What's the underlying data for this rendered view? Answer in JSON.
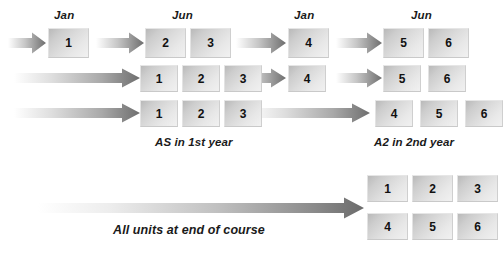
{
  "diagram": {
    "title_labels": {
      "timeline_months": [
        {
          "text": "Jan",
          "x": 54,
          "y": 9
        },
        {
          "text": "Jun",
          "x": 172,
          "y": 9
        },
        {
          "text": "Jan",
          "x": 294,
          "y": 9
        },
        {
          "text": "Jun",
          "x": 411,
          "y": 9
        }
      ]
    },
    "rows": [
      {
        "name": "route-row-1",
        "arrows": [
          {
            "x": 8,
            "y": 32,
            "w": 38,
            "h": 22
          },
          {
            "x": 96,
            "y": 32,
            "w": 48,
            "h": 22
          },
          {
            "x": 236,
            "y": 32,
            "w": 50,
            "h": 22
          },
          {
            "x": 336,
            "y": 32,
            "w": 46,
            "h": 22
          }
        ],
        "units": [
          {
            "label": "1",
            "x": 48,
            "y": 28,
            "w": 41,
            "h": 30
          },
          {
            "label": "2",
            "x": 145,
            "y": 28,
            "w": 41,
            "h": 30
          },
          {
            "label": "3",
            "x": 190,
            "y": 28,
            "w": 41,
            "h": 30
          },
          {
            "label": "4",
            "x": 288,
            "y": 28,
            "w": 41,
            "h": 30
          },
          {
            "label": "5",
            "x": 383,
            "y": 28,
            "w": 41,
            "h": 30
          },
          {
            "label": "6",
            "x": 428,
            "y": 28,
            "w": 41,
            "h": 30
          }
        ]
      },
      {
        "name": "route-row-2",
        "arrows": [
          {
            "x": 14,
            "y": 68,
            "w": 126,
            "h": 20
          },
          {
            "x": 236,
            "y": 68,
            "w": 50,
            "h": 20
          },
          {
            "x": 336,
            "y": 68,
            "w": 46,
            "h": 20
          }
        ],
        "units": [
          {
            "label": "1",
            "x": 140,
            "y": 65,
            "w": 38,
            "h": 27
          },
          {
            "label": "2",
            "x": 182,
            "y": 65,
            "w": 38,
            "h": 27
          },
          {
            "label": "3",
            "x": 224,
            "y": 65,
            "w": 38,
            "h": 27
          },
          {
            "label": "4",
            "x": 288,
            "y": 65,
            "w": 38,
            "h": 27
          },
          {
            "label": "5",
            "x": 383,
            "y": 65,
            "w": 38,
            "h": 27
          },
          {
            "label": "6",
            "x": 428,
            "y": 65,
            "w": 38,
            "h": 27
          }
        ]
      },
      {
        "name": "route-row-3",
        "arrows": [
          {
            "x": 14,
            "y": 103,
            "w": 126,
            "h": 20
          },
          {
            "x": 248,
            "y": 103,
            "w": 122,
            "h": 20
          }
        ],
        "units": [
          {
            "label": "1",
            "x": 140,
            "y": 100,
            "w": 38,
            "h": 27
          },
          {
            "label": "2",
            "x": 182,
            "y": 100,
            "w": 38,
            "h": 27
          },
          {
            "label": "3",
            "x": 224,
            "y": 100,
            "w": 38,
            "h": 27
          },
          {
            "label": "4",
            "x": 375,
            "y": 100,
            "w": 38,
            "h": 27
          },
          {
            "label": "5",
            "x": 420,
            "y": 100,
            "w": 38,
            "h": 27
          },
          {
            "label": "6",
            "x": 465,
            "y": 100,
            "w": 38,
            "h": 27
          }
        ]
      }
    ],
    "captions": [
      {
        "name": "caption-as-first-year",
        "text": "AS in 1st year",
        "x": 155,
        "y": 136
      },
      {
        "name": "caption-a2-second-year",
        "text": "A2 in 2nd year",
        "x": 374,
        "y": 136
      }
    ],
    "summary": {
      "name": "route-row-summary",
      "arrow": {
        "x": 38,
        "y": 197,
        "w": 326,
        "h": 22
      },
      "units_top": [
        {
          "label": "1",
          "x": 367,
          "y": 175,
          "w": 41,
          "h": 27
        },
        {
          "label": "2",
          "x": 412,
          "y": 175,
          "w": 41,
          "h": 27
        },
        {
          "label": "3",
          "x": 457,
          "y": 175,
          "w": 41,
          "h": 27
        }
      ],
      "units_bottom": [
        {
          "label": "4",
          "x": 367,
          "y": 213,
          "w": 41,
          "h": 27
        },
        {
          "label": "5",
          "x": 412,
          "y": 213,
          "w": 41,
          "h": 27
        },
        {
          "label": "6",
          "x": 457,
          "y": 213,
          "w": 41,
          "h": 27
        }
      ],
      "caption": {
        "name": "caption-all-units",
        "text": "All units at end of course",
        "x": 113,
        "y": 223
      }
    },
    "colors": {
      "arrow_dark": "#6e6e6e",
      "arrow_light": "#f4f4f4",
      "box_light": "#f1f1f1",
      "box_dark": "#b9b9b9",
      "text": "#1a1a1a"
    }
  }
}
